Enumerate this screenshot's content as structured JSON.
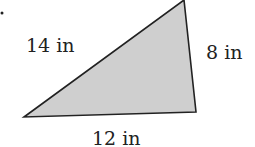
{
  "diagram": {
    "shape": "triangle",
    "fill": "#cfcfcf",
    "stroke": "#222222",
    "sides": {
      "left": "14 in",
      "right": "8 in",
      "bottom": "12 in"
    }
  }
}
